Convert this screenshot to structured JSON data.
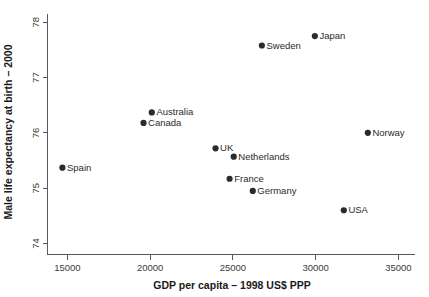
{
  "chart_data": {
    "type": "scatter",
    "title": "",
    "xlabel": "GDP per capita – 1998 US$ PPP",
    "ylabel": "Male life expectancy at birth – 2000",
    "xlim": [
      13800,
      36000
    ],
    "ylim": [
      73.8,
      78.15
    ],
    "grid": false,
    "legend": "none",
    "xticks": [
      15000,
      20000,
      25000,
      30000,
      35000
    ],
    "xtick_labels": [
      "15000",
      "20000",
      "25000",
      "30000",
      "35000"
    ],
    "yticks": [
      74,
      75,
      76,
      77,
      78
    ],
    "ytick_labels": [
      "74",
      "75",
      "76",
      "77",
      "78"
    ],
    "marker_color": "#2b2b2b",
    "axis_color": "#555a5e",
    "points": [
      {
        "label": "Spain",
        "x": 14700,
        "y": 75.37
      },
      {
        "label": "Canada",
        "x": 19600,
        "y": 76.18
      },
      {
        "label": "Australia",
        "x": 20100,
        "y": 76.37
      },
      {
        "label": "UK",
        "x": 23950,
        "y": 75.72
      },
      {
        "label": "France",
        "x": 24800,
        "y": 75.17
      },
      {
        "label": "Netherlands",
        "x": 25050,
        "y": 75.57
      },
      {
        "label": "Germany",
        "x": 26200,
        "y": 74.95
      },
      {
        "label": "Sweden",
        "x": 26750,
        "y": 77.58
      },
      {
        "label": "Japan",
        "x": 29950,
        "y": 77.75
      },
      {
        "label": "USA",
        "x": 31700,
        "y": 74.6
      },
      {
        "label": "Norway",
        "x": 33150,
        "y": 76.0
      }
    ]
  }
}
